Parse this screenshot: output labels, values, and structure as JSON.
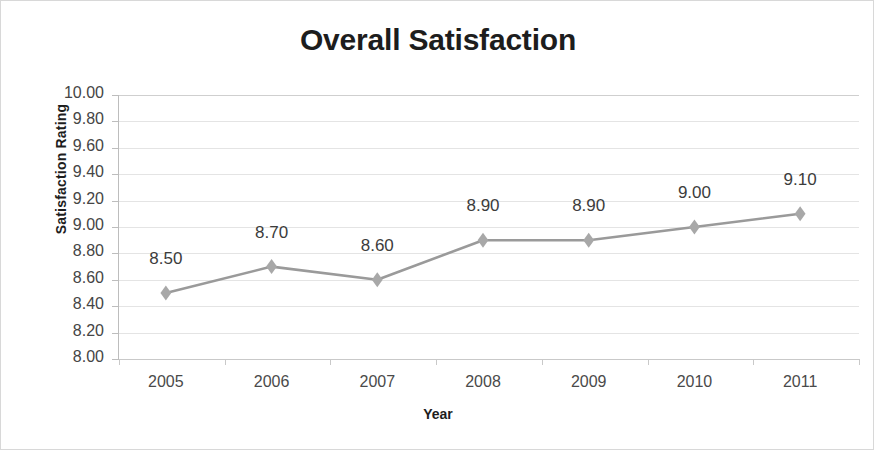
{
  "chart_data": {
    "type": "line",
    "title": "Overall Satisfaction",
    "xlabel": "Year",
    "ylabel": "Satisfaction Rating",
    "categories": [
      "2005",
      "2006",
      "2007",
      "2008",
      "2009",
      "2010",
      "2011"
    ],
    "values": [
      8.5,
      8.7,
      8.6,
      8.9,
      8.9,
      9.0,
      9.1
    ],
    "point_labels": [
      "8.50",
      "8.70",
      "8.60",
      "8.90",
      "8.90",
      "9.00",
      "9.10"
    ],
    "ylim": [
      8.0,
      10.0
    ],
    "ytick_step": 0.2,
    "ytick_labels": [
      "10.00",
      "9.80",
      "9.60",
      "9.40",
      "9.20",
      "9.00",
      "8.80",
      "8.60",
      "8.40",
      "8.20",
      "8.00"
    ],
    "ytick_values": [
      10.0,
      9.8,
      9.6,
      9.4,
      9.2,
      9.0,
      8.8,
      8.6,
      8.4,
      8.2,
      8.0
    ],
    "grid": true,
    "legend": false,
    "series": [
      {
        "name": "Overall Satisfaction",
        "values": [
          8.5,
          8.7,
          8.6,
          8.9,
          8.9,
          9.0,
          9.1
        ],
        "marker": "diamond",
        "line_color": "#9a9a9a",
        "marker_color": "#a8a8a8"
      }
    ],
    "colors": {
      "line": "#9a9a9a",
      "marker": "#a8a8a8",
      "grid": "#e4e4e4",
      "axis": "#bdbdbd",
      "title_text": "#1d1d1d",
      "tick_text": "#4a4a4a",
      "label_text": "#3c3c3c",
      "background": "#ffffff",
      "border": "#d8d8d8"
    }
  }
}
